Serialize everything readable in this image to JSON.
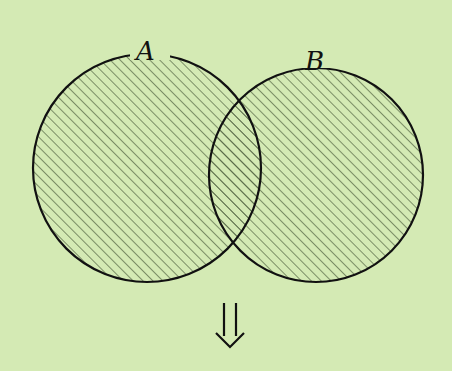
{
  "diagram": {
    "type": "venn",
    "background": "#d4eab4",
    "sets": [
      {
        "label": "A",
        "cx": 147,
        "cy": 168,
        "r": 114
      },
      {
        "label": "B",
        "cx": 316,
        "cy": 175,
        "r": 107
      }
    ],
    "shading": "union (A ∪ B) hatched",
    "hatch_color": "#4a5a3a",
    "arrow": "⇓"
  }
}
